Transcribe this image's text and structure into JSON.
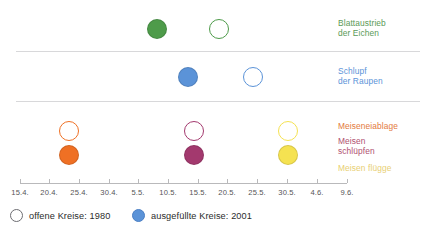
{
  "chart_data": {
    "type": "scatter",
    "title": "",
    "xlabel": "",
    "ylabel": "",
    "grid": false,
    "legend_position": "bottom-left",
    "x_axis": {
      "tick_labels": [
        "15.4.",
        "20.4.",
        "25.4.",
        "30.4.",
        "5.5.",
        "10.5.",
        "15.5.",
        "20.5.",
        "25.5.",
        "30.5.",
        "4.6.",
        "9.6."
      ],
      "tick_positions_px": [
        20,
        49,
        79,
        109,
        138,
        168,
        198,
        227,
        257,
        287,
        317,
        347
      ],
      "range_start": "15.4.",
      "range_end": "9.6."
    },
    "series": [
      {
        "name": "Blattaustrieb der Eichen",
        "color": "#4e9b4a",
        "label_color": "#5a9a57",
        "points": [
          {
            "year": "2001",
            "style": "filled",
            "date": "10.5.",
            "x_px": 157,
            "y_px": 29,
            "r_px": 10
          },
          {
            "year": "1980",
            "style": "open",
            "date": "20.5.",
            "x_px": 219,
            "y_px": 29,
            "r_px": 10
          }
        ]
      },
      {
        "name": "Schlupf der Raupen",
        "color": "#5b93d8",
        "label_color": "#5b93d8",
        "points": [
          {
            "year": "2001",
            "style": "filled",
            "date": "15.5.",
            "x_px": 188,
            "y_px": 77,
            "r_px": 10
          },
          {
            "year": "1980",
            "style": "open",
            "date": "25.5.",
            "x_px": 253,
            "y_px": 77,
            "r_px": 10
          }
        ]
      },
      {
        "name": "Meiseneiablage",
        "color": "#ef7024",
        "label_color": "#e3793c",
        "points": [
          {
            "year": "1980",
            "style": "open",
            "date": "24.4.",
            "x_px": 69,
            "y_px": 131,
            "r_px": 10
          },
          {
            "year": "2001",
            "style": "filled",
            "date": "24.4.",
            "x_px": 69,
            "y_px": 155,
            "r_px": 10
          }
        ]
      },
      {
        "name": "Meisen schlüpfen",
        "color": "#a3396e",
        "label_color": "#b05070",
        "points": [
          {
            "year": "1980",
            "style": "open",
            "date": "15.5.",
            "x_px": 194,
            "y_px": 131,
            "r_px": 10
          },
          {
            "year": "2001",
            "style": "filled",
            "date": "15.5.",
            "x_px": 194,
            "y_px": 155,
            "r_px": 10
          }
        ]
      },
      {
        "name": "Meisen flügge",
        "color": "#f5e251",
        "label_color": "#e8cf73",
        "points": [
          {
            "year": "1980",
            "style": "open",
            "date": "1.6.",
            "x_px": 288,
            "y_px": 131,
            "r_px": 10
          },
          {
            "year": "2001",
            "style": "filled",
            "date": "1.6.",
            "x_px": 288,
            "y_px": 155,
            "r_px": 10
          }
        ]
      }
    ]
  },
  "rows": [
    {
      "label": "Blattaustrieb\nder Eichen",
      "color": "#5a9a57",
      "top_px": 18
    },
    {
      "label": "Schlupf\nder Raupen",
      "color": "#5b93d8",
      "top_px": 66
    },
    {
      "label": "Meiseneiablage",
      "color": "#e3793c",
      "top_px": 121
    },
    {
      "label": "Meisen\nschlüpfen",
      "color": "#b05070",
      "top_px": 136
    },
    {
      "label": "Meisen flügge",
      "color": "#e8cf73",
      "top_px": 163
    }
  ],
  "legend": {
    "open_label": "offene Kreise: 1980",
    "filled_label": "ausgefüllte Kreise: 2001",
    "open_color": "#ffffff",
    "filled_color": "#5b93d8"
  },
  "colors": {
    "divider": "#d8d8da",
    "axis": "#b9b9bb",
    "tick_text": "#555555",
    "background": "#ffffff"
  }
}
